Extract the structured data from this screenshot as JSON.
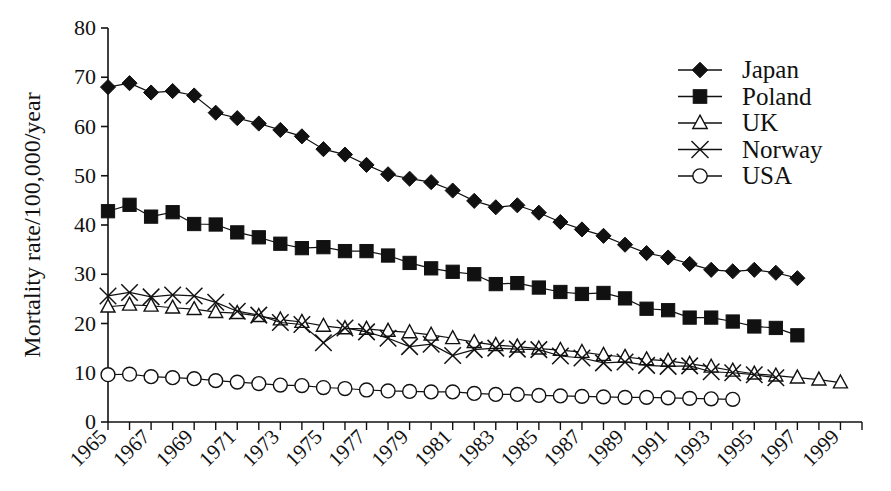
{
  "chart_data": {
    "type": "line",
    "title": "",
    "xlabel": "",
    "ylabel": "Mortality rate/100,000/year",
    "xlim": [
      1965,
      2000
    ],
    "ylim": [
      0,
      80
    ],
    "ytick_values": [
      0,
      10,
      20,
      30,
      40,
      50,
      60,
      70,
      80
    ],
    "ytick_labels": [
      "0",
      "10",
      "20",
      "30",
      "40",
      "50",
      "60",
      "70",
      "80"
    ],
    "xtick_values": [
      1965,
      1966,
      1967,
      1968,
      1969,
      1970,
      1971,
      1972,
      1973,
      1974,
      1975,
      1976,
      1977,
      1978,
      1979,
      1980,
      1981,
      1982,
      1983,
      1984,
      1985,
      1986,
      1987,
      1988,
      1989,
      1990,
      1991,
      1992,
      1993,
      1994,
      1995,
      1996,
      1997,
      1998,
      1999,
      2000
    ],
    "xtick_labels": [
      "1965",
      "1967",
      "1969",
      "1971",
      "1973",
      "1975",
      "1977",
      "1979",
      "1981",
      "1983",
      "1985",
      "1987",
      "1989",
      "1991",
      "1993",
      "1995",
      "1997",
      "1999"
    ],
    "xtick_label_values": [
      1965,
      1967,
      1969,
      1971,
      1973,
      1975,
      1977,
      1979,
      1981,
      1983,
      1985,
      1987,
      1989,
      1991,
      1993,
      1995,
      1997,
      1999
    ],
    "grid": false,
    "legend_position": "top-right",
    "series": [
      {
        "name": "Japan",
        "marker": "filled-diamond",
        "color": "#111111",
        "x": [
          1965,
          1966,
          1967,
          1968,
          1969,
          1970,
          1971,
          1972,
          1973,
          1974,
          1975,
          1976,
          1977,
          1978,
          1979,
          1980,
          1981,
          1982,
          1983,
          1984,
          1985,
          1986,
          1987,
          1988,
          1989,
          1990,
          1991,
          1992,
          1993,
          1994,
          1995,
          1996,
          1997,
          1998,
          1999
        ],
        "values": [
          68.0,
          68.8,
          66.9,
          67.2,
          66.3,
          62.8,
          61.7,
          60.6,
          59.3,
          58.0,
          55.4,
          54.3,
          52.2,
          50.3,
          49.4,
          48.7,
          47.0,
          44.9,
          43.6,
          44.0,
          42.5,
          40.6,
          39.1,
          37.8,
          36.0,
          34.3,
          33.4,
          32.1,
          30.9,
          30.6,
          30.9,
          30.3,
          29.2,
          null,
          null
        ]
      },
      {
        "name": "Poland",
        "marker": "filled-square",
        "color": "#111111",
        "x": [
          1965,
          1966,
          1967,
          1968,
          1969,
          1970,
          1971,
          1972,
          1973,
          1974,
          1975,
          1976,
          1977,
          1978,
          1979,
          1980,
          1981,
          1982,
          1983,
          1984,
          1985,
          1986,
          1987,
          1988,
          1989,
          1990,
          1991,
          1992,
          1993,
          1994,
          1995,
          1996,
          1997,
          1998
        ],
        "values": [
          42.8,
          44.1,
          41.7,
          42.6,
          40.2,
          40.1,
          38.5,
          37.5,
          36.2,
          35.3,
          35.5,
          34.7,
          34.7,
          33.8,
          32.3,
          31.2,
          30.5,
          30.0,
          28.0,
          28.2,
          27.3,
          26.4,
          26.0,
          26.2,
          25.1,
          23.0,
          22.7,
          21.2,
          21.2,
          20.4,
          19.4,
          19.1,
          17.6,
          null
        ]
      },
      {
        "name": "UK",
        "marker": "open-triangle",
        "color": "#111111",
        "x": [
          1965,
          1966,
          1967,
          1968,
          1969,
          1970,
          1971,
          1972,
          1973,
          1974,
          1975,
          1976,
          1977,
          1978,
          1979,
          1980,
          1981,
          1982,
          1983,
          1984,
          1985,
          1986,
          1987,
          1988,
          1989,
          1990,
          1991,
          1992,
          1993,
          1994,
          1995,
          1996,
          1997,
          1998,
          1999
        ],
        "values": [
          23.4,
          23.8,
          23.6,
          23.2,
          22.9,
          22.3,
          22.1,
          21.5,
          20.8,
          20.3,
          19.5,
          19.0,
          18.9,
          18.5,
          18.2,
          17.7,
          17.0,
          16.2,
          15.6,
          15.3,
          14.9,
          14.6,
          14.2,
          13.6,
          13.2,
          12.7,
          12.4,
          11.8,
          11.2,
          10.4,
          9.8,
          9.4,
          9.0,
          8.6,
          8.0
        ]
      },
      {
        "name": "Norway",
        "marker": "cross-x",
        "color": "#111111",
        "x": [
          1965,
          1966,
          1967,
          1968,
          1969,
          1970,
          1971,
          1972,
          1973,
          1974,
          1975,
          1976,
          1977,
          1978,
          1979,
          1980,
          1981,
          1982,
          1983,
          1984,
          1985,
          1986,
          1987,
          1988,
          1989,
          1990,
          1991,
          1992,
          1993,
          1994,
          1995,
          1996
        ],
        "values": [
          25.6,
          26.3,
          25.4,
          25.8,
          25.6,
          24.3,
          22.5,
          21.7,
          20.2,
          19.8,
          16.1,
          19.1,
          18.3,
          17.0,
          15.3,
          15.8,
          13.5,
          14.7,
          15.0,
          14.8,
          14.7,
          13.4,
          13.0,
          12.0,
          12.2,
          11.5,
          11.3,
          11.4,
          10.2,
          10.0,
          9.6,
          9.0
        ]
      },
      {
        "name": "USA",
        "marker": "open-circle",
        "color": "#111111",
        "x": [
          1965,
          1966,
          1967,
          1968,
          1969,
          1970,
          1971,
          1972,
          1973,
          1974,
          1975,
          1976,
          1977,
          1978,
          1979,
          1980,
          1981,
          1982,
          1983,
          1984,
          1985,
          1986,
          1987,
          1988,
          1989,
          1990,
          1991,
          1992,
          1993,
          1994
        ],
        "values": [
          9.6,
          9.7,
          9.2,
          9.0,
          8.8,
          8.4,
          8.1,
          7.8,
          7.5,
          7.4,
          7.0,
          6.8,
          6.5,
          6.3,
          6.2,
          6.1,
          6.1,
          5.8,
          5.6,
          5.6,
          5.4,
          5.3,
          5.2,
          5.1,
          5.0,
          5.0,
          4.9,
          4.8,
          4.7,
          4.6
        ]
      }
    ]
  },
  "legend": {
    "entries": [
      {
        "label": "Japan",
        "marker": "filled-diamond"
      },
      {
        "label": "Poland",
        "marker": "filled-square"
      },
      {
        "label": "UK",
        "marker": "open-triangle"
      },
      {
        "label": "Norway",
        "marker": "cross-x"
      },
      {
        "label": "USA",
        "marker": "open-circle"
      }
    ]
  },
  "axes": {
    "y_axis_title": "Mortality rate/100,000/year"
  }
}
